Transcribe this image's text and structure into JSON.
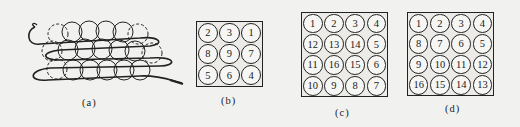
{
  "panels": {
    "a": {
      "label": "(a)",
      "description": "serpentine path winding through three rows of circular cells"
    },
    "b": {
      "label": "(b)",
      "rows": 3,
      "cols": 3,
      "cells": [
        [
          "2",
          "3",
          "1"
        ],
        [
          "8",
          "9",
          "7"
        ],
        [
          "5",
          "6",
          "4"
        ]
      ]
    },
    "c": {
      "label": "(c)",
      "rows": 4,
      "cols": 4,
      "cells": [
        [
          "1",
          "2",
          "3",
          "4"
        ],
        [
          "12",
          "13",
          "14",
          "5"
        ],
        [
          "11",
          "16",
          "15",
          "6"
        ],
        [
          "10",
          "9",
          "8",
          "7"
        ]
      ]
    },
    "d": {
      "label": "(d)",
      "rows": 4,
      "cols": 4,
      "cells": [
        [
          "1",
          "2",
          "3",
          "4"
        ],
        [
          "8",
          "7",
          "6",
          "5"
        ],
        [
          "9",
          "10",
          "11",
          "12"
        ],
        [
          "16",
          "15",
          "14",
          "13"
        ]
      ]
    }
  },
  "colors": {
    "line": "#222222",
    "background": "#f1f1ef"
  }
}
